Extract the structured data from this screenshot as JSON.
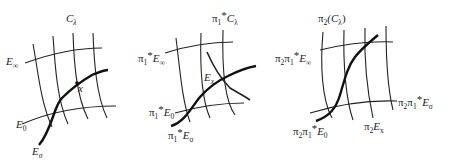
{
  "figure": {
    "panels": [
      {
        "id": "panel-1",
        "labels": {
          "fiber_family": "C",
          "fiber_family_sub": "λ",
          "e_infinity": "E",
          "e_infinity_sub": "∞",
          "e_zero": "E",
          "e_zero_sub": "0",
          "e_sigma": "E",
          "e_sigma_sub": "σ",
          "point": "x"
        }
      },
      {
        "id": "panel-2",
        "labels": {
          "pi": "π",
          "pi_sub": "1",
          "star": "*",
          "fiber_family": "C",
          "fiber_family_sub": "λ",
          "e_infinity": "E",
          "e_infinity_sub": "∞",
          "e_zero": "E",
          "e_zero_sub": "0",
          "e_sigma": "E",
          "e_sigma_sub": "σ",
          "exceptional": "E",
          "exceptional_sub": "x"
        }
      },
      {
        "id": "panel-3",
        "labels": {
          "pi2": "π",
          "pi2_sub": "2",
          "pi1": "π",
          "pi1_sub": "1",
          "star": "*",
          "fiber_family_prefix": "(C",
          "fiber_family_sub": "λ",
          "fiber_family_suffix": ")",
          "e_infinity": "E",
          "e_infinity_sub": "∞",
          "e_sigma": "E",
          "e_sigma_sub": "σ",
          "e_zero": "E",
          "e_zero_sub": "0",
          "exceptional": "E",
          "exceptional_sub": "x"
        }
      }
    ]
  }
}
